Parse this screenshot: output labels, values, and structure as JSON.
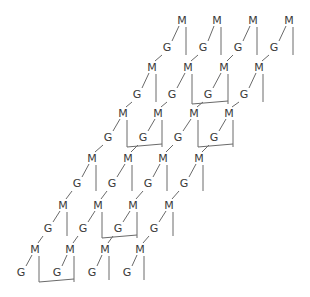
{
  "diagram": {
    "type": "lattice",
    "labels": {
      "top": "M",
      "bottom": "G"
    },
    "colors": {
      "text": "#3a3a3a",
      "line": "#6a6a6a",
      "background": "#ffffff"
    },
    "rows": [
      {
        "m_y": 24,
        "g_y": 51,
        "m_x": [
          182,
          217,
          253,
          289
        ],
        "g_x": [
          167,
          203,
          238,
          274
        ],
        "brackets": []
      },
      {
        "m_y": 71,
        "g_y": 98,
        "m_x": [
          152,
          188,
          224,
          259
        ],
        "g_x": [
          137,
          172,
          208,
          244
        ],
        "brackets": [
          [
            1,
            2
          ]
        ]
      },
      {
        "m_y": 117,
        "g_y": 141,
        "m_x": [
          123,
          158,
          194,
          229
        ],
        "g_x": [
          108,
          143,
          178,
          214
        ],
        "brackets": [
          [
            0,
            1
          ],
          [
            2,
            3
          ]
        ]
      },
      {
        "m_y": 162,
        "g_y": 187,
        "m_x": [
          92,
          128,
          163,
          199
        ],
        "g_x": [
          77,
          112,
          148,
          184
        ],
        "brackets": []
      },
      {
        "m_y": 209,
        "g_y": 232,
        "m_x": [
          63,
          98,
          133,
          169
        ],
        "g_x": [
          48,
          83,
          118,
          154
        ],
        "brackets": [
          [
            1,
            2
          ]
        ]
      },
      {
        "m_y": 253,
        "g_y": 276,
        "m_x": [
          35,
          70,
          105,
          140
        ],
        "g_x": [
          21,
          57,
          92,
          127
        ],
        "brackets": [
          [
            0,
            1
          ]
        ]
      }
    ]
  }
}
